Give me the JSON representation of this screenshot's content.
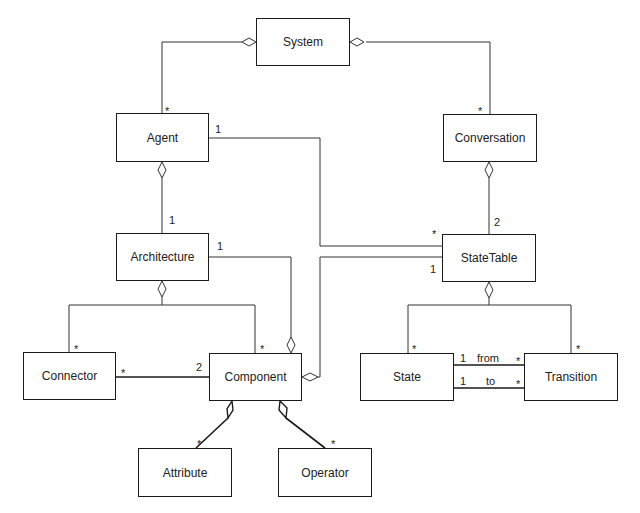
{
  "diagram": {
    "type": "UML class diagram",
    "classes": {
      "system": "System",
      "agent": "Agent",
      "conversation": "Conversation",
      "architecture": "Architecture",
      "statetable": "StateTable",
      "connector": "Connector",
      "component": "Component",
      "state": "State",
      "transition": "Transition",
      "attribute": "Attribute",
      "operator": "Operator"
    },
    "multiplicities": {
      "system_agent": "*",
      "system_conversation": "*",
      "agent_statetable_agent": "1",
      "agent_statetable_table": "*",
      "agent_architecture": "1",
      "conversation_statetable": "2",
      "architecture_component": "1",
      "statetable_component": "1",
      "architecture_connector": "*",
      "architecture_component_part": "*",
      "connector_side": "*",
      "component_side": "2",
      "statetable_state": "*",
      "statetable_transition": "*",
      "from_state": "1",
      "from_transition": "*",
      "to_state": "1",
      "to_transition": "*",
      "component_attribute": "*",
      "component_operator": "*"
    },
    "roles": {
      "from": "from",
      "to": "to"
    },
    "colors": {
      "line": "#1a1a1a",
      "background": "#ffffff"
    }
  }
}
